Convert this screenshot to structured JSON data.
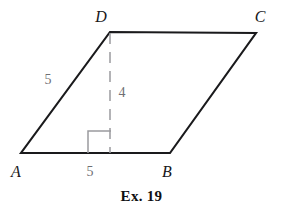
{
  "figure": {
    "caption": "Ex. 19",
    "shape_name": "parallelogram-abcd",
    "colors": {
      "outline": "#1a1a1c",
      "dashed_altitude": "#9a9a9e",
      "right_angle_marker": "#9a9a9e",
      "measure_text": "#6f6f74",
      "vertex_text": "#17171a",
      "caption_text": "#0f0f12",
      "background": "#ffffff"
    },
    "vertices": [
      {
        "label": "A",
        "x": 21,
        "y": 153,
        "label_x": 16,
        "label_y": 172
      },
      {
        "label": "B",
        "x": 170,
        "y": 153,
        "label_x": 167,
        "label_y": 172
      },
      {
        "label": "C",
        "x": 256,
        "y": 33,
        "label_x": 260,
        "label_y": 17
      },
      {
        "label": "D",
        "x": 110,
        "y": 32,
        "label_x": 101,
        "label_y": 17
      }
    ],
    "measurements": [
      {
        "name": "side-ad-length",
        "value": "5",
        "x": 48,
        "y": 80
      },
      {
        "name": "altitude-length",
        "value": "4",
        "x": 122,
        "y": 93
      },
      {
        "name": "base-ab-length",
        "value": "5",
        "x": 90,
        "y": 172
      }
    ],
    "altitude": {
      "from_x": 110,
      "from_y": 33,
      "to_x": 110,
      "to_y": 153,
      "style": "dashed"
    },
    "right_angle_marker": {
      "left": 88,
      "right": 111,
      "top": 131,
      "bottom": 153
    }
  }
}
